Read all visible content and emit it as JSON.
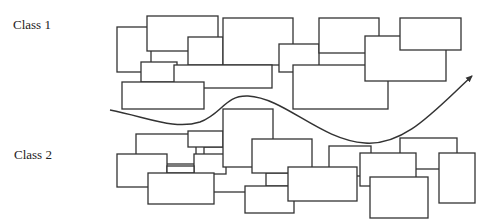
{
  "labels": {
    "class1": "Class 1",
    "class2": "Class 2"
  },
  "colors": {
    "stroke": "#333333",
    "fill": "#ffffff",
    "text": "#222222"
  },
  "class1_boxes": [
    {
      "x": 117,
      "y": 27,
      "w": 34,
      "h": 45
    },
    {
      "x": 141,
      "y": 62,
      "w": 36,
      "h": 20
    },
    {
      "x": 147,
      "y": 16,
      "w": 71,
      "h": 35
    },
    {
      "x": 188,
      "y": 37,
      "w": 35,
      "h": 28
    },
    {
      "x": 223,
      "y": 18,
      "w": 70,
      "h": 47
    },
    {
      "x": 174,
      "y": 65,
      "w": 98,
      "h": 23
    },
    {
      "x": 122,
      "y": 82,
      "w": 82,
      "h": 27
    },
    {
      "x": 279,
      "y": 44,
      "w": 40,
      "h": 28
    },
    {
      "x": 319,
      "y": 18,
      "w": 60,
      "h": 35
    },
    {
      "x": 293,
      "y": 65,
      "w": 95,
      "h": 44
    },
    {
      "x": 365,
      "y": 36,
      "w": 81,
      "h": 45
    },
    {
      "x": 400,
      "y": 18,
      "w": 61,
      "h": 32
    }
  ],
  "class2_boxes": [
    {
      "x": 136,
      "y": 134,
      "w": 60,
      "h": 30
    },
    {
      "x": 204,
      "y": 147,
      "w": 22,
      "h": 10
    },
    {
      "x": 194,
      "y": 154,
      "w": 32,
      "h": 20
    },
    {
      "x": 188,
      "y": 131,
      "w": 35,
      "h": 16
    },
    {
      "x": 117,
      "y": 154,
      "w": 50,
      "h": 33
    },
    {
      "x": 167,
      "y": 166,
      "w": 27,
      "h": 7
    },
    {
      "x": 148,
      "y": 173,
      "w": 66,
      "h": 31
    },
    {
      "x": 223,
      "y": 109,
      "w": 50,
      "h": 58
    },
    {
      "x": 266,
      "y": 173,
      "w": 24,
      "h": 13
    },
    {
      "x": 214,
      "y": 192,
      "w": 31,
      "h": 0.01
    },
    {
      "x": 252,
      "y": 139,
      "w": 60,
      "h": 34
    },
    {
      "x": 245,
      "y": 186,
      "w": 49,
      "h": 27
    },
    {
      "x": 329,
      "y": 146,
      "w": 42,
      "h": 30
    },
    {
      "x": 288,
      "y": 167,
      "w": 69,
      "h": 34
    },
    {
      "x": 400,
      "y": 138,
      "w": 57,
      "h": 31
    },
    {
      "x": 360,
      "y": 153,
      "w": 56,
      "h": 33
    },
    {
      "x": 370,
      "y": 177,
      "w": 58,
      "h": 41
    },
    {
      "x": 439,
      "y": 153,
      "w": 36,
      "h": 50
    }
  ],
  "decision_boundary": {
    "path": "M110,110 C150,118 175,130 200,122 C222,114 225,95 248,96 C285,98 320,140 365,143 C405,146 435,110 472,76",
    "arrow_tip": {
      "x": 472,
      "y": 75
    }
  }
}
